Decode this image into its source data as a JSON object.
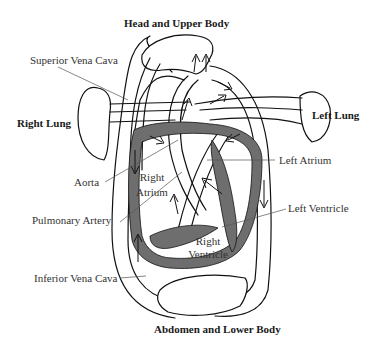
{
  "diagram": {
    "type": "circulatory-system-heart-diagram",
    "colors": {
      "outline": "#111111",
      "heart_wall": "#6e6e6e",
      "vessel_fill": "#ffffff",
      "label_text": "#333333",
      "leader_line": "#555555"
    },
    "regions": {
      "top": "Head and Upper Body",
      "bottom": "Abdomen and Lower Body",
      "left_lung": "Left Lung",
      "right_lung": "Right Lung"
    },
    "labels": {
      "superior_vena_cava": "Superior Vena Cava",
      "aorta": "Aorta",
      "pulmonary_artery": "Pulmonary Artery",
      "inferior_vena_cava": "Inferior Vena Cava",
      "left_atrium": "Left Atrium",
      "left_ventricle": "Left Ventricle",
      "right_atrium_line1": "Right",
      "right_atrium_line2": "Atrium",
      "right_ventricle_line1": "Right",
      "right_ventricle_line2": "Ventricle"
    }
  }
}
